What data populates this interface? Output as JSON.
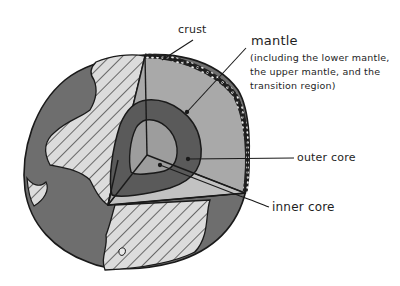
{
  "diagram": {
    "labels": {
      "crust": "crust",
      "mantle": "mantle",
      "mantle_description": "(including the lower mantle, the upper mantle, and the transition region)",
      "outer_core": "outer core",
      "inner_core": "inner core"
    },
    "colors": {
      "ocean": "#6e6e6e",
      "land": "#d9d9d9",
      "mantle": "#a9a9a9",
      "outer_core": "#5a5a5a",
      "inner_core": "#9d9d9d",
      "wedge_floor": "#c2c2c2",
      "outline": "#1a1a1a",
      "background": "#ffffff"
    }
  }
}
